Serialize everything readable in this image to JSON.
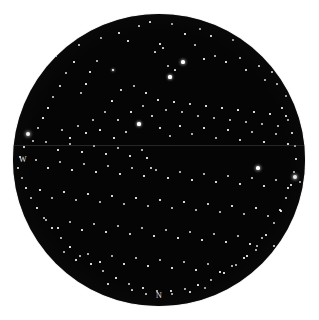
{
  "plate": {
    "type": "star-field-photographic-plate",
    "canvas": {
      "width": 319,
      "height": 320
    },
    "background_color": "#ffffff",
    "field_color": "#050505",
    "star_color": "#ffffff",
    "disc": {
      "cx": 159,
      "cy": 160,
      "r": 146
    },
    "seam": {
      "y": 145,
      "color": "#787878"
    }
  },
  "cardinal_labels": [
    {
      "name": "west-label",
      "text": "W",
      "x": 23,
      "y": 160
    },
    {
      "name": "north-label",
      "text": "N",
      "x": 159,
      "y": 296
    }
  ],
  "chart_data": {
    "type": "scatter",
    "title": "",
    "xlabel": "",
    "ylabel": "",
    "grid": false,
    "legend": null,
    "annotations": [
      "W",
      "N"
    ],
    "projection": "circular-field-of-view",
    "field_center": [
      159,
      160
    ],
    "field_radius": 146,
    "point_count": 214,
    "size_scale": "apparent magnitude, larger radius = brighter star",
    "stars": [
      [
        150,
        22,
        1.1
      ],
      [
        172,
        24,
        0.9
      ],
      [
        139,
        26,
        0.8
      ],
      [
        200,
        29,
        0.9
      ],
      [
        119,
        33,
        1.0
      ],
      [
        56,
        56,
        1.1
      ],
      [
        60,
        47,
        0.9
      ],
      [
        79,
        45,
        1.2
      ],
      [
        101,
        38,
        0.9
      ],
      [
        128,
        41,
        1.0
      ],
      [
        185,
        34,
        1.0
      ],
      [
        211,
        36,
        1.0
      ],
      [
        233,
        40,
        0.9
      ],
      [
        253,
        46,
        1.0
      ],
      [
        268,
        52,
        0.9
      ],
      [
        183,
        62,
        2.4
      ],
      [
        170,
        77,
        2.0
      ],
      [
        175,
        70,
        0.8
      ],
      [
        168,
        66,
        0.9
      ],
      [
        163,
        48,
        0.8
      ],
      [
        160,
        44,
        1.0
      ],
      [
        155,
        52,
        0.8
      ],
      [
        195,
        45,
        0.9
      ],
      [
        204,
        59,
        1.0
      ],
      [
        215,
        56,
        0.9
      ],
      [
        226,
        62,
        1.0
      ],
      [
        240,
        58,
        0.9
      ],
      [
        246,
        70,
        1.2
      ],
      [
        259,
        66,
        0.8
      ],
      [
        272,
        72,
        1.2
      ],
      [
        284,
        78,
        0.9
      ],
      [
        290,
        88,
        1.0
      ],
      [
        286,
        96,
        0.9
      ],
      [
        277,
        84,
        0.8
      ],
      [
        265,
        80,
        0.9
      ],
      [
        113,
        70,
        1.8
      ],
      [
        97,
        61,
        0.9
      ],
      [
        90,
        72,
        1.0
      ],
      [
        86,
        84,
        1.1
      ],
      [
        81,
        93,
        0.9
      ],
      [
        74,
        62,
        1.0
      ],
      [
        66,
        73,
        0.9
      ],
      [
        60,
        86,
        1.2
      ],
      [
        53,
        97,
        0.9
      ],
      [
        48,
        108,
        1.0
      ],
      [
        43,
        118,
        1.1
      ],
      [
        38,
        128,
        0.9
      ],
      [
        28,
        134,
        2.6
      ],
      [
        33,
        141,
        0.9
      ],
      [
        24,
        147,
        1.0
      ],
      [
        20,
        157,
        0.9
      ],
      [
        18,
        168,
        1.0
      ],
      [
        22,
        178,
        0.9
      ],
      [
        26,
        188,
        1.1
      ],
      [
        31,
        198,
        0.9
      ],
      [
        37,
        208,
        1.0
      ],
      [
        44,
        218,
        0.9
      ],
      [
        52,
        228,
        1.0
      ],
      [
        61,
        238,
        0.9
      ],
      [
        70,
        247,
        1.1
      ],
      [
        80,
        256,
        0.9
      ],
      [
        91,
        264,
        1.0
      ],
      [
        103,
        271,
        0.9
      ],
      [
        116,
        278,
        1.0
      ],
      [
        129,
        284,
        0.9
      ],
      [
        143,
        288,
        1.0
      ],
      [
        157,
        291,
        0.9
      ],
      [
        171,
        291,
        1.0
      ],
      [
        185,
        289,
        0.9
      ],
      [
        198,
        285,
        1.1
      ],
      [
        211,
        280,
        0.9
      ],
      [
        224,
        273,
        1.0
      ],
      [
        236,
        265,
        0.9
      ],
      [
        247,
        256,
        1.0
      ],
      [
        257,
        246,
        0.9
      ],
      [
        266,
        235,
        1.0
      ],
      [
        274,
        223,
        0.9
      ],
      [
        281,
        211,
        1.1
      ],
      [
        286,
        198,
        0.9
      ],
      [
        291,
        185,
        1.0
      ],
      [
        294,
        172,
        0.9
      ],
      [
        295,
        177,
        2.5
      ],
      [
        296,
        159,
        1.0
      ],
      [
        295,
        146,
        0.9
      ],
      [
        292,
        133,
        1.0
      ],
      [
        288,
        120,
        0.9
      ],
      [
        282,
        108,
        1.0
      ],
      [
        121,
        90,
        1.2
      ],
      [
        134,
        86,
        0.9
      ],
      [
        146,
        93,
        1.0
      ],
      [
        112,
        101,
        1.1
      ],
      [
        105,
        112,
        0.9
      ],
      [
        118,
        120,
        1.4
      ],
      [
        131,
        112,
        1.0
      ],
      [
        143,
        106,
        0.9
      ],
      [
        152,
        116,
        1.2
      ],
      [
        139,
        124,
        2.0
      ],
      [
        126,
        132,
        1.6
      ],
      [
        114,
        138,
        1.0
      ],
      [
        100,
        130,
        1.1
      ],
      [
        93,
        120,
        0.9
      ],
      [
        86,
        133,
        1.0
      ],
      [
        78,
        126,
        0.9
      ],
      [
        70,
        138,
        1.0
      ],
      [
        62,
        130,
        0.9
      ],
      [
        158,
        100,
        1.0
      ],
      [
        166,
        110,
        0.9
      ],
      [
        174,
        102,
        1.0
      ],
      [
        182,
        112,
        0.9
      ],
      [
        190,
        104,
        1.2
      ],
      [
        198,
        116,
        0.9
      ],
      [
        206,
        106,
        1.0
      ],
      [
        214,
        118,
        0.9
      ],
      [
        222,
        108,
        1.0
      ],
      [
        230,
        120,
        0.9
      ],
      [
        238,
        110,
        1.1
      ],
      [
        246,
        122,
        0.9
      ],
      [
        254,
        112,
        1.0
      ],
      [
        262,
        124,
        0.9
      ],
      [
        270,
        114,
        1.0
      ],
      [
        278,
        126,
        0.9
      ],
      [
        286,
        116,
        1.0
      ],
      [
        160,
        128,
        1.0
      ],
      [
        170,
        136,
        0.9
      ],
      [
        180,
        126,
        1.0
      ],
      [
        192,
        134,
        0.9
      ],
      [
        204,
        128,
        1.0
      ],
      [
        216,
        138,
        0.9
      ],
      [
        228,
        130,
        1.0
      ],
      [
        240,
        140,
        1.2
      ],
      [
        252,
        132,
        0.9
      ],
      [
        264,
        142,
        1.0
      ],
      [
        276,
        134,
        0.9
      ],
      [
        288,
        144,
        1.0
      ],
      [
        46,
        142,
        0.9
      ],
      [
        58,
        150,
        1.0
      ],
      [
        70,
        144,
        0.9
      ],
      [
        82,
        152,
        1.0
      ],
      [
        94,
        146,
        0.9
      ],
      [
        106,
        154,
        1.0
      ],
      [
        118,
        148,
        0.9
      ],
      [
        130,
        156,
        1.0
      ],
      [
        142,
        150,
        0.9
      ],
      [
        151,
        168,
        1.4
      ],
      [
        147,
        158,
        1.0
      ],
      [
        36,
        160,
        0.9
      ],
      [
        48,
        168,
        1.0
      ],
      [
        60,
        162,
        0.9
      ],
      [
        72,
        170,
        1.0
      ],
      [
        84,
        164,
        0.9
      ],
      [
        96,
        172,
        1.0
      ],
      [
        108,
        166,
        0.9
      ],
      [
        120,
        174,
        1.0
      ],
      [
        132,
        168,
        0.9
      ],
      [
        144,
        176,
        1.0
      ],
      [
        156,
        170,
        0.9
      ],
      [
        168,
        178,
        1.0
      ],
      [
        180,
        172,
        0.9
      ],
      [
        192,
        180,
        1.0
      ],
      [
        204,
        174,
        0.9
      ],
      [
        216,
        182,
        1.0
      ],
      [
        228,
        176,
        0.9
      ],
      [
        240,
        184,
        1.0
      ],
      [
        252,
        178,
        0.9
      ],
      [
        258,
        168,
        2.4
      ],
      [
        264,
        186,
        1.0
      ],
      [
        276,
        180,
        0.9
      ],
      [
        288,
        188,
        1.0
      ],
      [
        300,
        182,
        0.9
      ],
      [
        40,
        190,
        1.0
      ],
      [
        52,
        198,
        0.9
      ],
      [
        64,
        192,
        1.0
      ],
      [
        76,
        200,
        0.9
      ],
      [
        88,
        194,
        1.0
      ],
      [
        100,
        202,
        0.9
      ],
      [
        112,
        196,
        1.0
      ],
      [
        124,
        204,
        0.9
      ],
      [
        136,
        198,
        1.0
      ],
      [
        148,
        206,
        0.9
      ],
      [
        160,
        200,
        1.0
      ],
      [
        172,
        208,
        0.9
      ],
      [
        184,
        202,
        1.0
      ],
      [
        196,
        210,
        0.9
      ],
      [
        208,
        204,
        1.2
      ],
      [
        220,
        212,
        0.9
      ],
      [
        232,
        206,
        1.0
      ],
      [
        244,
        214,
        0.9
      ],
      [
        256,
        208,
        1.0
      ],
      [
        268,
        216,
        0.9
      ],
      [
        280,
        210,
        1.0
      ],
      [
        46,
        220,
        0.9
      ],
      [
        58,
        228,
        1.0
      ],
      [
        70,
        222,
        0.9
      ],
      [
        82,
        230,
        1.0
      ],
      [
        94,
        224,
        0.9
      ],
      [
        106,
        232,
        1.0
      ],
      [
        118,
        226,
        0.9
      ],
      [
        130,
        234,
        1.2
      ],
      [
        142,
        228,
        0.9
      ],
      [
        154,
        236,
        1.0
      ],
      [
        166,
        230,
        0.9
      ],
      [
        178,
        238,
        1.0
      ],
      [
        190,
        232,
        0.9
      ],
      [
        202,
        240,
        1.0
      ],
      [
        214,
        234,
        0.9
      ],
      [
        226,
        242,
        1.0
      ],
      [
        238,
        236,
        0.9
      ],
      [
        250,
        244,
        1.0
      ],
      [
        262,
        238,
        0.9
      ],
      [
        274,
        246,
        1.0
      ],
      [
        64,
        252,
        0.9
      ],
      [
        76,
        260,
        1.0
      ],
      [
        88,
        254,
        0.9
      ],
      [
        100,
        262,
        1.0
      ],
      [
        112,
        256,
        0.9
      ],
      [
        124,
        264,
        1.0
      ],
      [
        136,
        258,
        0.9
      ],
      [
        148,
        266,
        1.0
      ],
      [
        160,
        260,
        0.9
      ],
      [
        172,
        268,
        1.0
      ],
      [
        184,
        262,
        0.9
      ],
      [
        196,
        270,
        1.0
      ],
      [
        208,
        264,
        0.9
      ],
      [
        220,
        272,
        1.0
      ],
      [
        232,
        266,
        0.9
      ],
      [
        244,
        258,
        1.0
      ],
      [
        256,
        250,
        0.9
      ],
      [
        108,
        284,
        1.0
      ],
      [
        146,
        294,
        0.8
      ],
      [
        172,
        294,
        0.9
      ],
      [
        190,
        292,
        1.0
      ],
      [
        132,
        290,
        0.8
      ],
      [
        205,
        288,
        0.9
      ]
    ]
  }
}
